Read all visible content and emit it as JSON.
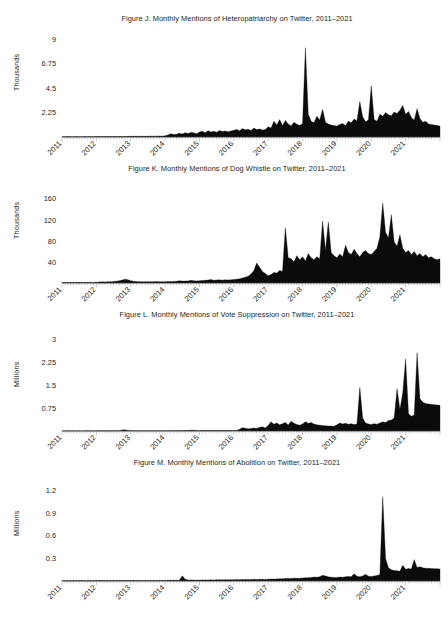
{
  "page": {
    "background": "#ffffff",
    "foreground": "#231f20",
    "series_color": "#0b0b0b"
  },
  "figures": [
    {
      "id": "figure-j",
      "title": "Figure J. Monthly Mentions of Heteropatriarchy on Twitter, 2011–2021",
      "ylabel": "Thousands",
      "ytick_labels": [
        "9",
        "6.75",
        "4.5",
        "2.25"
      ],
      "xtick_labels": [
        "2011",
        "2012",
        "2013",
        "2014",
        "2015",
        "2016",
        "2017",
        "2018",
        "2019",
        "2020",
        "2021"
      ]
    },
    {
      "id": "figure-k",
      "title": "Figure K. Monthly Mentions of Dog Whistle on Twitter, 2011–2021",
      "ylabel": "Thousands",
      "ytick_labels": [
        "160",
        "120",
        "80",
        "40"
      ],
      "xtick_labels": [
        "2011",
        "2012",
        "2013",
        "2014",
        "2015",
        "2016",
        "2017",
        "2018",
        "2019",
        "2020",
        "2021"
      ]
    },
    {
      "id": "figure-l",
      "title": "Figure L. Monthly Mentions of Vote Suppression on Twitter, 2011–2021",
      "ylabel": "Millions",
      "ytick_labels": [
        "3",
        "2.25",
        "1.5",
        "0.75"
      ],
      "xtick_labels": [
        "2011",
        "2012",
        "2013",
        "2014",
        "2015",
        "2016",
        "2017",
        "2018",
        "2019",
        "2020",
        "2021"
      ]
    },
    {
      "id": "figure-m",
      "title": "Figure M. Monthly Mentions of Abolition on Twitter, 2011–2021",
      "ylabel": "Millions",
      "ytick_labels": [
        "1.2",
        "0.9",
        "0.6",
        "0.3"
      ],
      "xtick_labels": [
        "2011",
        "2012",
        "2013",
        "2014",
        "2015",
        "2016",
        "2017",
        "2018",
        "2019",
        "2020",
        "2021"
      ]
    }
  ],
  "chart_data": [
    {
      "type": "area",
      "id": "figure-j",
      "title": "Figure J. Monthly Mentions of Heteropatriarchy on Twitter, 2011–2021",
      "xlabel": "",
      "ylabel": "Thousands",
      "unit": "thousands",
      "ylim": [
        0,
        9
      ],
      "yticks": [
        2.25,
        4.5,
        6.75,
        9
      ],
      "grid": false,
      "legend": "none",
      "x_start": "2011-01",
      "x_end": "2021-06",
      "x_interval": "monthly",
      "x_categories": [
        "2011",
        "2012",
        "2013",
        "2014",
        "2015",
        "2016",
        "2017",
        "2018",
        "2019",
        "2020",
        "2021"
      ],
      "values": [
        0.03,
        0.03,
        0.04,
        0.03,
        0.03,
        0.04,
        0.03,
        0.03,
        0.04,
        0.03,
        0.04,
        0.03,
        0.04,
        0.04,
        0.05,
        0.04,
        0.04,
        0.05,
        0.04,
        0.05,
        0.05,
        0.04,
        0.05,
        0.05,
        0.06,
        0.06,
        0.07,
        0.06,
        0.07,
        0.06,
        0.07,
        0.08,
        0.07,
        0.08,
        0.09,
        0.08,
        0.12,
        0.18,
        0.3,
        0.22,
        0.26,
        0.34,
        0.28,
        0.4,
        0.33,
        0.42,
        0.38,
        0.3,
        0.45,
        0.52,
        0.4,
        0.58,
        0.46,
        0.52,
        0.44,
        0.6,
        0.5,
        0.56,
        0.48,
        0.55,
        0.62,
        0.7,
        0.58,
        0.78,
        0.66,
        0.72,
        0.6,
        0.82,
        0.68,
        0.74,
        0.64,
        0.7,
        0.95,
        0.82,
        1.45,
        1.1,
        1.6,
        1.05,
        1.52,
        1.2,
        1.0,
        1.35,
        1.18,
        1.05,
        1.25,
        8.2,
        2.1,
        1.45,
        1.3,
        1.9,
        1.55,
        2.55,
        1.35,
        1.2,
        1.1,
        1.05,
        1.0,
        1.15,
        1.25,
        1.05,
        1.45,
        1.3,
        1.65,
        1.5,
        3.25,
        1.85,
        1.4,
        1.55,
        4.7,
        1.6,
        1.45,
        2.1,
        1.9,
        2.25,
        2.05,
        1.95,
        2.3,
        2.15,
        2.45,
        2.9,
        2.1,
        2.35,
        1.8,
        1.55,
        2.6,
        1.7,
        1.35,
        1.45,
        1.2,
        1.15,
        1.1,
        1.05,
        1.0
      ]
    },
    {
      "type": "area",
      "id": "figure-k",
      "title": "Figure K. Monthly Mentions of Dog Whistle on Twitter, 2011–2021",
      "xlabel": "",
      "ylabel": "Thousands",
      "unit": "thousands",
      "ylim": [
        0,
        175
      ],
      "yticks": [
        40,
        80,
        120,
        160
      ],
      "grid": false,
      "legend": "none",
      "x_start": "2011-01",
      "x_end": "2021-06",
      "x_interval": "monthly",
      "x_categories": [
        "2011",
        "2012",
        "2013",
        "2014",
        "2015",
        "2016",
        "2017",
        "2018",
        "2019",
        "2020",
        "2021"
      ],
      "values": [
        0.8,
        0.9,
        1.0,
        0.9,
        1.1,
        1.0,
        1.2,
        1.1,
        1.0,
        1.2,
        1.1,
        1.0,
        1.5,
        1.8,
        2.2,
        2.0,
        2.6,
        2.4,
        3.0,
        3.5,
        4.2,
        5.5,
        7.0,
        6.2,
        4.5,
        3.2,
        2.8,
        2.6,
        2.4,
        2.5,
        2.3,
        2.6,
        2.4,
        2.8,
        2.6,
        2.4,
        2.6,
        2.8,
        3.0,
        2.9,
        3.4,
        4.2,
        3.6,
        3.8,
        4.0,
        5.0,
        4.4,
        4.0,
        4.2,
        4.8,
        5.0,
        5.6,
        6.5,
        5.2,
        5.8,
        6.0,
        5.4,
        6.2,
        5.8,
        6.0,
        6.5,
        7.2,
        8.0,
        9.5,
        11.0,
        13.0,
        17.0,
        24.0,
        38.0,
        30.0,
        22.0,
        18.0,
        14.0,
        16.0,
        20.0,
        19.0,
        24.0,
        22.0,
        105.0,
        48.0,
        46.0,
        40.0,
        52.0,
        44.0,
        50.0,
        42.0,
        56.0,
        48.0,
        44.0,
        50.0,
        46.0,
        118.0,
        62.0,
        116.0,
        58.0,
        52.0,
        48.0,
        55.0,
        50.0,
        72.0,
        58.0,
        54.0,
        64.0,
        56.0,
        50.0,
        58.0,
        62.0,
        56.0,
        54.0,
        60.0,
        66.0,
        88.0,
        152.0,
        96.0,
        86.0,
        130.0,
        78.0,
        70.0,
        92.0,
        66.0,
        58.0,
        62.0,
        54.0,
        60.0,
        52.0,
        56.0,
        50.0,
        54.0,
        48.0,
        50.0,
        46.0,
        44.0,
        46.0
      ]
    },
    {
      "type": "area",
      "id": "figure-l",
      "title": "Figure L. Monthly Mentions of Vote Suppression on Twitter, 2011–2021",
      "xlabel": "",
      "ylabel": "Millions",
      "unit": "millions",
      "ylim": [
        0,
        3
      ],
      "yticks": [
        0.75,
        1.5,
        2.25,
        3
      ],
      "grid": false,
      "legend": "none",
      "x_start": "2011-01",
      "x_end": "2021-06",
      "x_interval": "monthly",
      "x_categories": [
        "2011",
        "2012",
        "2013",
        "2014",
        "2015",
        "2016",
        "2017",
        "2018",
        "2019",
        "2020",
        "2021"
      ],
      "values": [
        0.004,
        0.004,
        0.005,
        0.004,
        0.005,
        0.004,
        0.005,
        0.004,
        0.005,
        0.006,
        0.005,
        0.004,
        0.006,
        0.006,
        0.007,
        0.006,
        0.008,
        0.007,
        0.009,
        0.01,
        0.012,
        0.03,
        0.038,
        0.02,
        0.012,
        0.01,
        0.009,
        0.01,
        0.009,
        0.01,
        0.009,
        0.01,
        0.009,
        0.011,
        0.01,
        0.009,
        0.01,
        0.01,
        0.011,
        0.012,
        0.014,
        0.012,
        0.013,
        0.014,
        0.013,
        0.026,
        0.024,
        0.014,
        0.012,
        0.013,
        0.014,
        0.013,
        0.015,
        0.014,
        0.016,
        0.015,
        0.014,
        0.016,
        0.015,
        0.014,
        0.018,
        0.02,
        0.06,
        0.11,
        0.09,
        0.075,
        0.085,
        0.095,
        0.08,
        0.12,
        0.135,
        0.1,
        0.18,
        0.3,
        0.22,
        0.26,
        0.2,
        0.24,
        0.28,
        0.195,
        0.32,
        0.255,
        0.215,
        0.19,
        0.23,
        0.3,
        0.25,
        0.275,
        0.225,
        0.2,
        0.19,
        0.18,
        0.17,
        0.165,
        0.16,
        0.155,
        0.2,
        0.26,
        0.23,
        0.25,
        0.22,
        0.24,
        0.21,
        0.23,
        1.42,
        0.42,
        0.26,
        0.23,
        0.21,
        0.24,
        0.22,
        0.26,
        0.3,
        0.28,
        0.34,
        0.36,
        0.42,
        1.38,
        0.7,
        1.25,
        2.35,
        0.56,
        0.48,
        0.52,
        2.55,
        1.05,
        0.94,
        0.9,
        0.88,
        0.87,
        0.86,
        0.85,
        0.84
      ]
    },
    {
      "type": "area",
      "id": "figure-m",
      "title": "Figure M. Monthly Mentions of Abolition on Twitter, 2011–2021",
      "xlabel": "",
      "ylabel": "Millions",
      "unit": "millions",
      "ylim": [
        0,
        1.25
      ],
      "yticks": [
        0.3,
        0.6,
        0.9,
        1.2
      ],
      "grid": false,
      "legend": "none",
      "x_start": "2011-01",
      "x_end": "2021-06",
      "x_interval": "monthly",
      "x_categories": [
        "2011",
        "2012",
        "2013",
        "2014",
        "2015",
        "2016",
        "2017",
        "2018",
        "2019",
        "2020",
        "2021"
      ],
      "values": [
        0.004,
        0.004,
        0.005,
        0.004,
        0.005,
        0.004,
        0.005,
        0.005,
        0.004,
        0.005,
        0.005,
        0.004,
        0.005,
        0.005,
        0.006,
        0.005,
        0.006,
        0.005,
        0.006,
        0.006,
        0.005,
        0.006,
        0.006,
        0.005,
        0.006,
        0.007,
        0.006,
        0.007,
        0.007,
        0.006,
        0.007,
        0.008,
        0.007,
        0.008,
        0.008,
        0.007,
        0.008,
        0.009,
        0.01,
        0.009,
        0.011,
        0.01,
        0.07,
        0.022,
        0.014,
        0.013,
        0.012,
        0.011,
        0.012,
        0.013,
        0.014,
        0.013,
        0.015,
        0.014,
        0.016,
        0.017,
        0.016,
        0.018,
        0.017,
        0.016,
        0.018,
        0.019,
        0.018,
        0.02,
        0.019,
        0.021,
        0.02,
        0.022,
        0.021,
        0.023,
        0.022,
        0.021,
        0.024,
        0.026,
        0.025,
        0.028,
        0.03,
        0.029,
        0.032,
        0.034,
        0.033,
        0.036,
        0.038,
        0.035,
        0.04,
        0.044,
        0.042,
        0.048,
        0.052,
        0.05,
        0.058,
        0.075,
        0.068,
        0.055,
        0.05,
        0.046,
        0.048,
        0.052,
        0.05,
        0.056,
        0.06,
        0.058,
        0.095,
        0.062,
        0.058,
        0.066,
        0.09,
        0.064,
        0.06,
        0.068,
        0.072,
        0.085,
        1.12,
        0.3,
        0.175,
        0.15,
        0.14,
        0.135,
        0.13,
        0.21,
        0.155,
        0.165,
        0.16,
        0.285,
        0.18,
        0.19,
        0.175,
        0.17,
        0.168,
        0.166,
        0.164,
        0.162,
        0.16
      ]
    }
  ]
}
